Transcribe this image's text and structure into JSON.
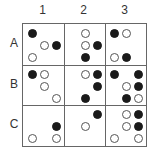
{
  "columns": [
    "1",
    "2",
    "3"
  ],
  "rows": [
    "A",
    "B",
    "C"
  ],
  "colors": {
    "filled": "#1a1a1a",
    "empty_border": "#555555",
    "grid": "#666666"
  },
  "cells": {
    "A1": [
      {
        "r": 0,
        "c": 0,
        "type": "filled"
      },
      {
        "r": 1,
        "c": 1,
        "type": "empty"
      },
      {
        "r": 1,
        "c": 2,
        "type": "filled"
      },
      {
        "r": 2,
        "c": 0,
        "type": "empty"
      }
    ],
    "A2": [
      {
        "r": 0,
        "c": 1,
        "type": "empty"
      },
      {
        "r": 1,
        "c": 1,
        "type": "empty"
      },
      {
        "r": 1,
        "c": 2,
        "type": "filled"
      },
      {
        "r": 2,
        "c": 1,
        "type": "filled"
      }
    ],
    "A3": [
      {
        "r": 0,
        "c": 0,
        "type": "filled"
      },
      {
        "r": 0,
        "c": 1,
        "type": "empty"
      },
      {
        "r": 2,
        "c": 0,
        "type": "empty"
      },
      {
        "r": 2,
        "c": 1,
        "type": "filled"
      }
    ],
    "B1": [
      {
        "r": 0,
        "c": 0,
        "type": "filled"
      },
      {
        "r": 0,
        "c": 1,
        "type": "empty"
      },
      {
        "r": 1,
        "c": 1,
        "type": "empty"
      },
      {
        "r": 2,
        "c": 2,
        "type": "empty"
      }
    ],
    "B2": [
      {
        "r": 0,
        "c": 1,
        "type": "empty"
      },
      {
        "r": 0,
        "c": 2,
        "type": "filled"
      },
      {
        "r": 1,
        "c": 2,
        "type": "filled"
      },
      {
        "r": 2,
        "c": 1,
        "type": "filled"
      }
    ],
    "B3": [
      {
        "r": 0,
        "c": 0,
        "type": "filled"
      },
      {
        "r": 0,
        "c": 2,
        "type": "filled"
      },
      {
        "r": 1,
        "c": 1,
        "type": "empty"
      },
      {
        "r": 1,
        "c": 2,
        "type": "filled"
      },
      {
        "r": 2,
        "c": 1,
        "type": "filled"
      },
      {
        "r": 2,
        "c": 2,
        "type": "empty"
      }
    ],
    "C1": [
      {
        "r": 1,
        "c": 2,
        "type": "filled"
      },
      {
        "r": 2,
        "c": 0,
        "type": "empty"
      },
      {
        "r": 2,
        "c": 2,
        "type": "empty"
      }
    ],
    "C2": [
      {
        "r": 0,
        "c": 2,
        "type": "filled"
      },
      {
        "r": 1,
        "c": 1,
        "type": "empty"
      }
    ],
    "C3": [
      {
        "r": 0,
        "c": 1,
        "type": "empty"
      },
      {
        "r": 0,
        "c": 2,
        "type": "filled"
      },
      {
        "r": 1,
        "c": 1,
        "type": "empty"
      },
      {
        "r": 1,
        "c": 2,
        "type": "filled"
      },
      {
        "r": 2,
        "c": 0,
        "type": "empty"
      },
      {
        "r": 2,
        "c": 2,
        "type": "empty"
      }
    ]
  }
}
